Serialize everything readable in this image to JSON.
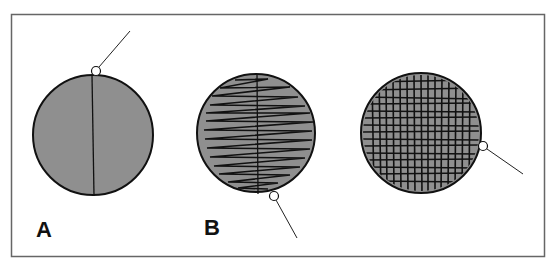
{
  "figure": {
    "panels": [
      {
        "label": "A",
        "description": "single pass"
      },
      {
        "label": "B",
        "description": "zigzag pass"
      },
      {
        "label": "",
        "description": "crosshatch"
      }
    ],
    "colors": {
      "fill": "#8f8f8f",
      "stroke": "#111111",
      "frame": "#555555"
    }
  }
}
